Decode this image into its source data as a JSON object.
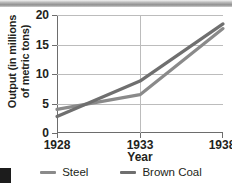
{
  "chart_data": {
    "type": "line",
    "title": "",
    "xlabel": "Year",
    "ylabel": "Output (in millions of metric tons)",
    "ylabel_lines": [
      "Output (in millions",
      "of metric tons)"
    ],
    "x": [
      1928,
      1933,
      1938
    ],
    "xlim": [
      1928,
      1938
    ],
    "ylim": [
      0,
      20
    ],
    "xticks": [
      "1928",
      "1933",
      "1938"
    ],
    "yticks": [
      "0",
      "5",
      "10",
      "15",
      "20"
    ],
    "grid": true,
    "legend_position": "bottom",
    "series": [
      {
        "name": "Steel",
        "color": "#8a8a8a",
        "values": [
          4.0,
          6.5,
          17.7
        ]
      },
      {
        "name": "Brown Coal",
        "color": "#6f6f6f",
        "values": [
          2.8,
          8.8,
          18.5
        ]
      }
    ]
  },
  "colors": {
    "axis": "#6d6d6d",
    "grid": "#bcbcbc",
    "text": "#231f20",
    "steel": "#8a8a8a",
    "brown_coal": "#6f6f6f"
  }
}
